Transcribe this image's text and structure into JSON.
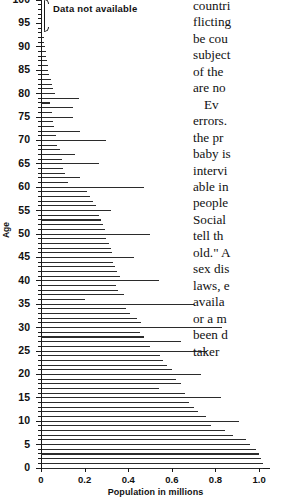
{
  "chart_data": {
    "type": "bar",
    "orientation": "horizontal",
    "title": "",
    "xlabel": "Population in millions",
    "ylabel": "Age",
    "xlim": [
      0,
      1.05
    ],
    "ylim": [
      0,
      100
    ],
    "xticks": [
      "0",
      "0.2",
      "0.4",
      "0.6",
      "0.8",
      "1.0"
    ],
    "xtick_values": [
      0,
      0.2,
      0.4,
      0.6,
      0.8,
      1.0
    ],
    "yticks": [
      "100",
      "95",
      "90",
      "85",
      "80",
      "75",
      "70",
      "65",
      "60",
      "55",
      "50",
      "45",
      "40",
      "35",
      "30",
      "25",
      "20",
      "15",
      "10",
      "5",
      "0"
    ],
    "ytick_values": [
      100,
      95,
      90,
      85,
      80,
      75,
      70,
      65,
      60,
      55,
      50,
      45,
      40,
      35,
      30,
      25,
      20,
      15,
      10,
      5,
      0
    ],
    "grid": false,
    "legend": false,
    "annotation": {
      "text": "Data not available",
      "applies_to_ages": "93-100"
    },
    "categories": [
      100,
      99,
      98,
      97,
      96,
      95,
      94,
      93,
      92,
      91,
      90,
      89,
      88,
      87,
      86,
      85,
      84,
      83,
      82,
      81,
      80,
      79,
      78,
      77,
      76,
      75,
      74,
      73,
      72,
      71,
      70,
      69,
      68,
      67,
      66,
      65,
      64,
      63,
      62,
      61,
      60,
      59,
      58,
      57,
      56,
      55,
      54,
      53,
      52,
      51,
      50,
      49,
      48,
      47,
      46,
      45,
      44,
      43,
      42,
      41,
      40,
      39,
      38,
      37,
      36,
      35,
      34,
      33,
      32,
      31,
      30,
      29,
      28,
      27,
      26,
      25,
      24,
      23,
      22,
      21,
      20,
      19,
      18,
      17,
      16,
      15,
      14,
      13,
      12,
      11,
      10,
      9,
      8,
      7,
      6,
      5,
      4,
      3,
      2,
      1,
      0
    ],
    "values": [
      0,
      0,
      0,
      0,
      0,
      0,
      0,
      0,
      0.012,
      0.016,
      0.018,
      0.022,
      0.024,
      0.026,
      0.03,
      0.034,
      0.038,
      0.044,
      0.05,
      0.056,
      0.062,
      0.175,
      0.04,
      0.145,
      0.05,
      0.148,
      0.055,
      0.06,
      0.18,
      0.07,
      0.3,
      0.075,
      0.085,
      0.155,
      0.095,
      0.265,
      0.1,
      0.11,
      0.18,
      0.125,
      0.47,
      0.21,
      0.225,
      0.24,
      0.25,
      0.32,
      0.265,
      0.275,
      0.285,
      0.295,
      0.5,
      0.3,
      0.31,
      0.32,
      0.325,
      0.425,
      0.33,
      0.34,
      0.35,
      0.36,
      0.54,
      0.345,
      0.355,
      0.38,
      0.2,
      0.7,
      0.39,
      0.41,
      0.44,
      0.46,
      0.83,
      0.455,
      0.47,
      0.64,
      0.5,
      0.76,
      0.545,
      0.56,
      0.58,
      0.6,
      0.735,
      0.62,
      0.64,
      0.54,
      0.66,
      0.825,
      0.68,
      0.7,
      0.72,
      0.755,
      0.91,
      0.78,
      0.845,
      0.88,
      0.94,
      0.96,
      0.985,
      1.0,
      1.01,
      1.02,
      1.02
    ]
  },
  "body_text": {
    "lines": [
      "countri",
      "flicting",
      "be cou",
      "subject",
      "of the",
      "are no",
      "Ev",
      "errors.",
      "the pr",
      "baby is",
      "intervi",
      "able in",
      "people",
      "Social",
      "tell th",
      "old.\" A",
      "sex dis",
      "laws, e",
      "availa",
      "or a m",
      "been d",
      "taker"
    ]
  }
}
